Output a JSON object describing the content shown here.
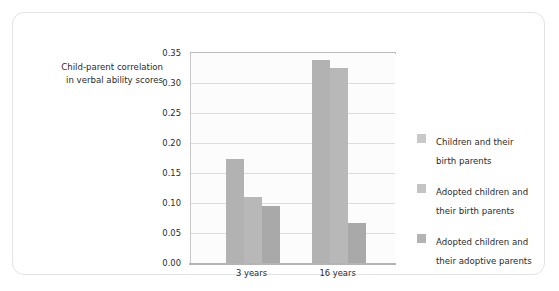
{
  "chart_data": {
    "type": "bar",
    "title": "",
    "ylabel": "Child-parent correlation\nin verbal ability scores",
    "xlabel": "",
    "categories": [
      "3 years",
      "16 years"
    ],
    "series": [
      {
        "name": "Children and their\nbirth parents",
        "values": [
          0.173,
          0.338
        ]
      },
      {
        "name": "Adopted children and\ntheir birth parents",
        "values": [
          0.11,
          0.325
        ]
      },
      {
        "name": "Adopted children and\ntheir adoptive parents",
        "values": [
          0.095,
          0.067
        ]
      }
    ],
    "ylim": [
      0.0,
      0.35
    ],
    "yticks": [
      "0.35",
      "0.30",
      "0.25",
      "0.20",
      "0.15",
      "0.10",
      "0.05",
      "0.00"
    ],
    "ytick_values": [
      0.35,
      0.3,
      0.25,
      0.2,
      0.15,
      0.1,
      0.05,
      0.0
    ],
    "grid": true,
    "legend_position": "right",
    "colors": {
      "bar1": "#b2b2b2",
      "bar2": "#b8b8b8",
      "bar3": "#a9a9a9",
      "gridline": "#dcdcdc",
      "axis": "#b4b4b4",
      "text": "#2b2b2b",
      "card_border": "#e3e3e3"
    }
  }
}
